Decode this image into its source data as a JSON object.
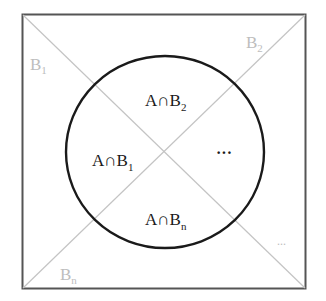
{
  "diagram": {
    "type": "partition-venn",
    "colors": {
      "square_border": "#555555",
      "diagonals": "#c4c4c4",
      "circle": "#1a1a1a",
      "outer_labels": "#bdbdbd",
      "inner_labels": "#1a1a1a"
    },
    "partition_labels": {
      "b1": {
        "base": "B",
        "sub": "1"
      },
      "b2": {
        "base": "B",
        "sub": "2"
      },
      "bn": {
        "base": "B",
        "sub": "n"
      },
      "ellipsis": "..."
    },
    "intersection_labels": {
      "ab1": {
        "base": "A∩B",
        "sub": "1"
      },
      "ab2": {
        "base": "A∩B",
        "sub": "2"
      },
      "abn": {
        "base": "A∩B",
        "sub": "n"
      },
      "ellipsis": "···"
    }
  }
}
